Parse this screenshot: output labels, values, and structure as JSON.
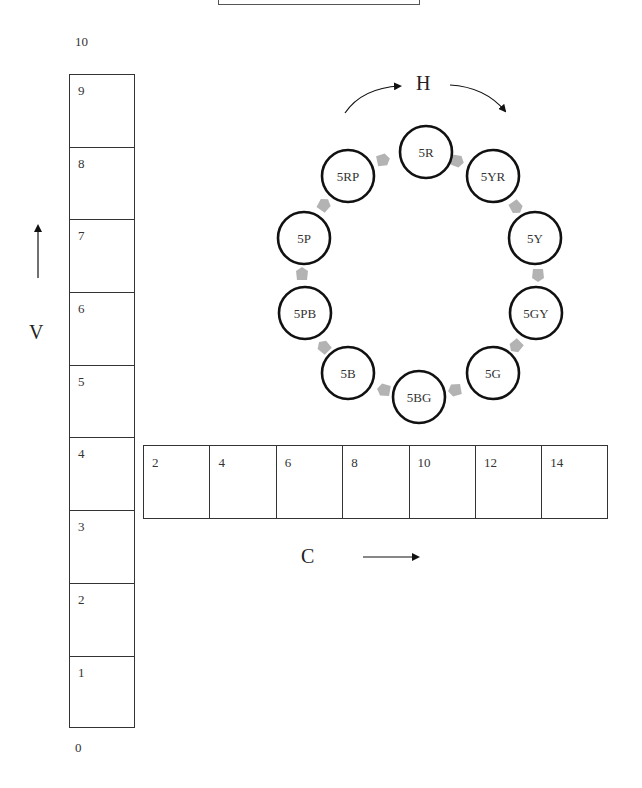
{
  "diagram": {
    "type": "munsell-color-system",
    "value_axis": {
      "letter": "V",
      "direction": "up",
      "top_label": "10",
      "bottom_label": "0",
      "cells": [
        "9",
        "8",
        "7",
        "6",
        "5",
        "4",
        "3",
        "2",
        "1"
      ]
    },
    "chroma_axis": {
      "letter": "C",
      "direction": "right",
      "cells": [
        "2",
        "4",
        "6",
        "8",
        "10",
        "12",
        "14"
      ]
    },
    "hue_wheel": {
      "letter": "H",
      "direction": "clockwise",
      "hues": [
        {
          "label": "5R",
          "cx": 426,
          "cy": 152
        },
        {
          "label": "5YR",
          "cx": 493,
          "cy": 176
        },
        {
          "label": "5Y",
          "cx": 535,
          "cy": 238
        },
        {
          "label": "5GY",
          "cx": 536,
          "cy": 313
        },
        {
          "label": "5G",
          "cx": 493,
          "cy": 373
        },
        {
          "label": "5BG",
          "cx": 419,
          "cy": 397
        },
        {
          "label": "5B",
          "cx": 348,
          "cy": 373
        },
        {
          "label": "5PB",
          "cx": 305,
          "cy": 313
        },
        {
          "label": "5P",
          "cx": 304,
          "cy": 238
        },
        {
          "label": "5RP",
          "cx": 348,
          "cy": 176
        }
      ],
      "connector_color": "#b3b3b3",
      "circle_stroke": "#111111"
    }
  }
}
